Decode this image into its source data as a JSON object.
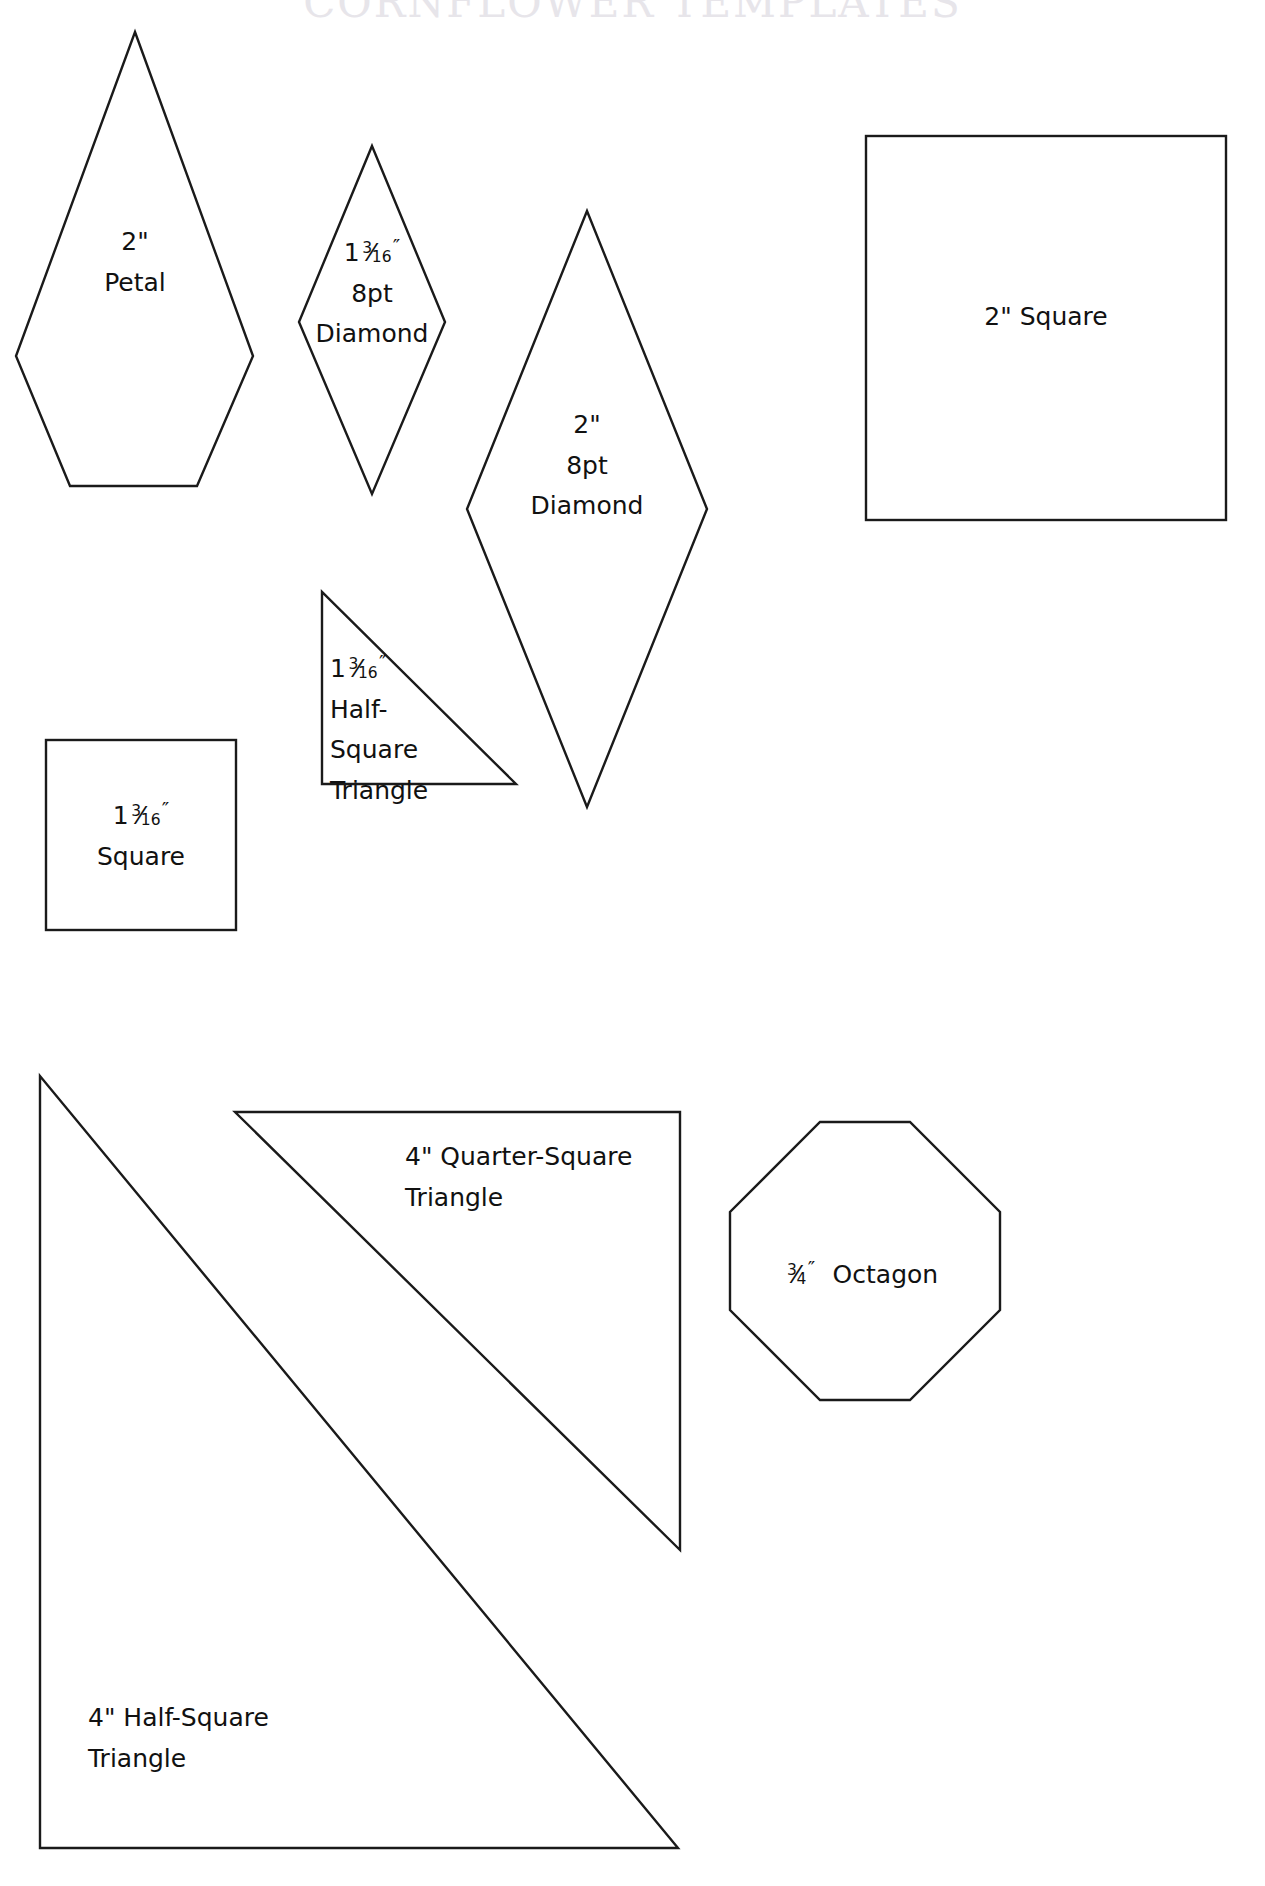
{
  "page": {
    "title": "CORNFLOWER TEMPLATES",
    "width": 1265,
    "height": 1886,
    "background_color": "#ffffff",
    "ink_color": "#1a1a1a",
    "title_color": "#e7e5ea"
  },
  "shapes": [
    {
      "id": "petal-2in",
      "name": "2\" Petal",
      "kind": "petal",
      "label_lines": [
        "2\"",
        "Petal"
      ]
    },
    {
      "id": "diamond-8pt-1-3-16in",
      "name": "1 3/16\" 8pt Diamond",
      "kind": "diamond",
      "label_lines": [
        "1 3/16\"",
        "8pt",
        "Diamond"
      ],
      "fraction": {
        "whole": "1",
        "numerator": "3",
        "denominator": "16",
        "unit": "″"
      }
    },
    {
      "id": "diamond-8pt-2in",
      "name": "2\" 8pt Diamond",
      "kind": "diamond",
      "label_lines": [
        "2\"",
        "8pt",
        "Diamond"
      ]
    },
    {
      "id": "square-2in",
      "name": "2\" Square",
      "kind": "square",
      "label_lines": [
        "2\" Square"
      ]
    },
    {
      "id": "square-1-3-16in",
      "name": "1 3/16\" Square",
      "kind": "square",
      "label_lines": [
        "1 3/16\"",
        "Square"
      ],
      "fraction": {
        "whole": "1",
        "numerator": "3",
        "denominator": "16",
        "unit": "″"
      }
    },
    {
      "id": "half-square-triangle-1-3-16in",
      "name": "1 3/16\" Half-Square Triangle",
      "kind": "triangle",
      "label_lines": [
        "1 3/16\"",
        "Half-",
        "Square",
        "Triangle"
      ],
      "fraction": {
        "whole": "1",
        "numerator": "3",
        "denominator": "16",
        "unit": "″"
      }
    },
    {
      "id": "quarter-square-triangle-4in",
      "name": "4\" Quarter-Square Triangle",
      "kind": "triangle",
      "label_lines": [
        "4\" Quarter-Square",
        "Triangle"
      ]
    },
    {
      "id": "half-square-triangle-4in",
      "name": "4\" Half-Square Triangle",
      "kind": "triangle",
      "label_lines": [
        "4\" Half-Square",
        "Triangle"
      ]
    },
    {
      "id": "octagon-3-4in",
      "name": "3/4\" Octagon",
      "kind": "octagon",
      "label_lines": [
        "3/4\"  Octagon"
      ],
      "fraction": {
        "whole": "",
        "numerator": "3",
        "denominator": "4",
        "unit": "″"
      },
      "trailing_text": "Octagon"
    }
  ],
  "labels": {
    "petal_size": "2\"",
    "petal_name": "Petal",
    "small_diamond_8pt": "8pt",
    "small_diamond_name": "Diamond",
    "big_diamond_size": "2\"",
    "big_diamond_8pt": "8pt",
    "big_diamond_name": "Diamond",
    "square_2in": "2\" Square",
    "square_small_name": "Square",
    "hst_small_l1": "Half-",
    "hst_small_l2": "Square",
    "hst_small_l3": "Triangle",
    "qst_l1": "4\" Quarter-Square",
    "qst_l2": "Triangle",
    "hst_l1": "4\" Half-Square",
    "hst_l2": "Triangle",
    "octagon_name": "Octagon",
    "frac_whole_1": "1",
    "frac_num_3": "3",
    "frac_den_16": "16",
    "frac_den_4": "4",
    "prime": "″",
    "slash": "⁄"
  }
}
